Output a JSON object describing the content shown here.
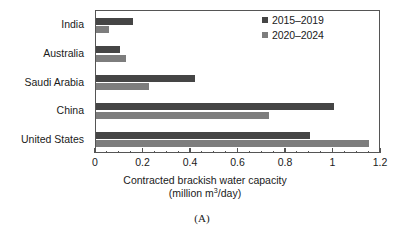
{
  "caption": "(A)",
  "legend": {
    "position": "top-right",
    "entries": [
      {
        "label": "2015–2019",
        "color": "#454545"
      },
      {
        "label": "2020–2024",
        "color": "#7d7d7d"
      }
    ]
  },
  "axis": {
    "title_line1": "Contracted brackish water capacity",
    "title_line2_pre": "(million m",
    "title_line2_sup": "3",
    "title_line2_post": "/day)",
    "tick_labels": [
      "0",
      "0.2",
      "0.4",
      "0.6",
      "0.8",
      "1",
      "1.2"
    ]
  },
  "chart_data": {
    "type": "bar",
    "orientation": "horizontal",
    "title": "",
    "xlabel": "Contracted brackish water capacity (million m3/day)",
    "ylabel": "",
    "xlim": [
      0,
      1.2
    ],
    "xticks": [
      0,
      0.2,
      0.4,
      0.6,
      0.8,
      1,
      1.2
    ],
    "xtick_labels": [
      "0",
      "0.2",
      "0.4",
      "0.6",
      "0.8",
      "1",
      "1.2"
    ],
    "minor_tick_step": 0.05,
    "grid": false,
    "legend_position": "top-right",
    "categories": [
      "India",
      "Australia",
      "Saudi Arabia",
      "China",
      "United States"
    ],
    "series": [
      {
        "name": "2015–2019",
        "color": "#454545",
        "values": [
          0.155,
          0.1,
          0.415,
          1.0,
          0.9
        ]
      },
      {
        "name": "2020–2024",
        "color": "#7d7d7d",
        "values": [
          0.055,
          0.125,
          0.225,
          0.73,
          1.15
        ]
      }
    ]
  }
}
